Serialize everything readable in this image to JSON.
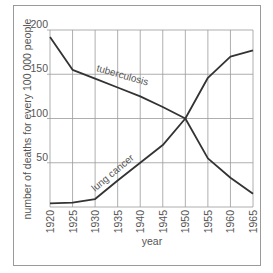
{
  "chart_data": {
    "type": "line",
    "title": "",
    "xlabel": "year",
    "ylabel": "number of deaths for every 100 000 people",
    "x": [
      1920,
      1925,
      1930,
      1935,
      1940,
      1945,
      1950,
      1955,
      1960,
      1965
    ],
    "x_tick_labels": [
      "1920",
      "1925",
      "1930",
      "1935",
      "1940",
      "1945",
      "1950",
      "1955",
      "1960",
      "1965"
    ],
    "y_tick_labels": [
      "50",
      "100",
      "150",
      "200"
    ],
    "ylim": [
      0,
      200
    ],
    "xlim": [
      1920,
      1965
    ],
    "grid": true,
    "legend": "inline labels on lines",
    "series": [
      {
        "name": "tuberculosis",
        "values": [
          192,
          155,
          145,
          135,
          125,
          113,
          100,
          55,
          33,
          15
        ]
      },
      {
        "name": "lung cancer",
        "values": [
          4,
          5,
          9,
          30,
          50,
          70,
          100,
          146,
          170,
          177
        ]
      }
    ]
  }
}
